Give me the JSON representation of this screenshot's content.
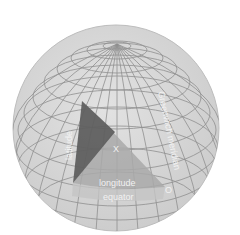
{
  "diagram": {
    "labels": {
      "latitude": "latitude",
      "longitude": "longitude",
      "equator": "equator",
      "meridian": "Greenwich meridian",
      "origin": "O",
      "point": "X"
    },
    "colors": {
      "background": "#ffffff",
      "sphere": "#d6d6d6",
      "grid": "#8c8c8c",
      "latitude_triangle": "#5f5f5f",
      "longitude_triangle": "#a9a9a9",
      "equator_band": "#c4c4c4"
    }
  }
}
